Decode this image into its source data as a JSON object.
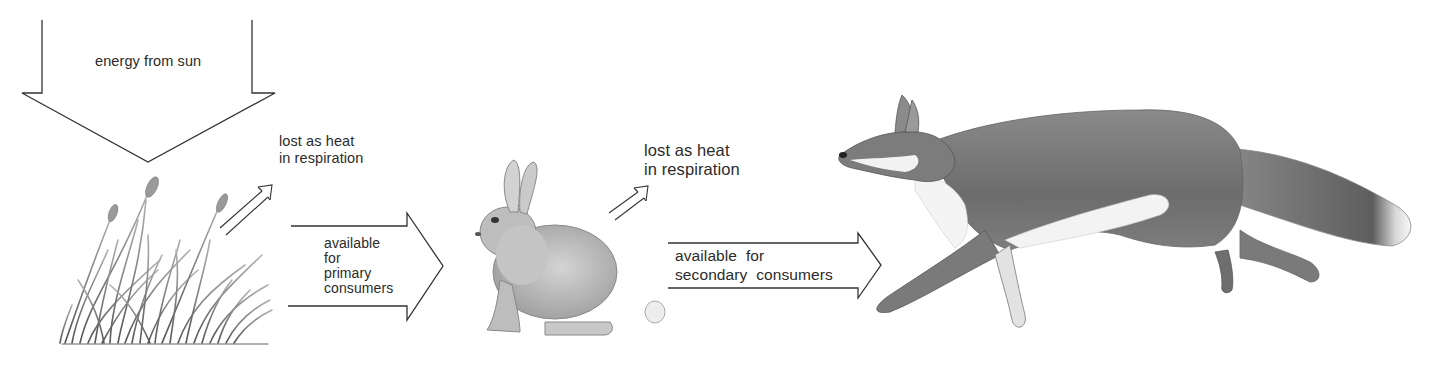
{
  "diagram": {
    "type": "energy-flow / food-chain",
    "nodes": [
      {
        "id": "grass",
        "label": "producer (grass)",
        "illustration": "grass-illustration"
      },
      {
        "id": "rabbit",
        "label": "primary consumer (rabbit)",
        "illustration": "rabbit-illustration"
      },
      {
        "id": "fox",
        "label": "secondary consumer (fox)",
        "illustration": "fox-illustration"
      }
    ],
    "labels": {
      "sun": "energy from sun",
      "heat_loss_1": "lost as heat\nin respiration",
      "primary": "available\nfor\nprimary\nconsumers",
      "heat_loss_2": "lost as heat\nin respiration",
      "secondary": "available  for\nsecondary  consumers"
    },
    "edges": [
      {
        "from": "sun",
        "to": "grass",
        "label": "energy from sun",
        "style": "large-down-arrow"
      },
      {
        "from": "grass",
        "to": "heat",
        "label": "lost as heat in respiration",
        "style": "small-double-arrow"
      },
      {
        "from": "grass",
        "to": "rabbit",
        "label": "available for primary consumers",
        "style": "block-arrow"
      },
      {
        "from": "rabbit",
        "to": "heat",
        "label": "lost as heat in respiration",
        "style": "small-double-arrow"
      },
      {
        "from": "rabbit",
        "to": "fox",
        "label": "available for secondary consumers",
        "style": "block-arrow"
      }
    ],
    "colors": {
      "line": "#333333",
      "grass": "#7a7a7a",
      "rabbit_fur": "#b8b8b8",
      "fox_fur": "#6e6e6e",
      "fox_white": "#f2f2f2",
      "background": "#ffffff"
    }
  }
}
